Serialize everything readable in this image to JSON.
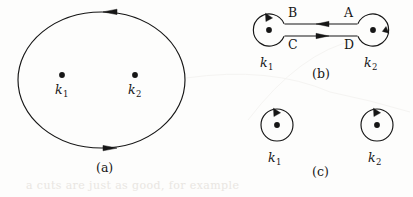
{
  "figure": {
    "background_color": "#fdfdfc",
    "ink_color": "#161616",
    "bleed_color": "#e9e6e2",
    "width": 413,
    "height": 197
  },
  "panels": [
    {
      "id": "a",
      "caption": "(a)",
      "caption_x": 96,
      "caption_y": 162,
      "description": "single large counterclockwise contour enclosing both poles",
      "contour": {
        "shape": "ellipse",
        "cx": 101.5,
        "cy": 80,
        "rx": 83.5,
        "ry": 68,
        "orientation": "counterclockwise",
        "arrows": [
          {
            "position": "top",
            "direction": "left",
            "x": 110,
            "y": 12
          },
          {
            "position": "bottom",
            "direction": "right",
            "x": 110,
            "y": 148
          }
        ]
      },
      "poles": [
        {
          "label": "k",
          "subscript": "1",
          "dot_x": 62,
          "dot_y": 75,
          "label_x": 55,
          "label_y": 84
        },
        {
          "label": "k",
          "subscript": "2",
          "dot_x": 135,
          "dot_y": 75,
          "label_x": 128,
          "label_y": 84
        }
      ]
    },
    {
      "id": "b",
      "caption": "(b)",
      "caption_x": 312,
      "caption_y": 68,
      "description": "two small contours joined by a two-way bridge of oppositely directed segments",
      "circles": [
        {
          "cx": 269,
          "cy": 30,
          "r": 16,
          "orientation": "counterclockwise",
          "arrow_position": "top",
          "arrow_direction": "left",
          "pole_label": "k",
          "pole_subscript": "1",
          "label_x": 255,
          "label_y": 58
        },
        {
          "cx": 373,
          "cy": 30,
          "r": 16,
          "orientation": "counterclockwise",
          "arrow_position": "right",
          "arrow_direction": "up",
          "pole_label": "k",
          "pole_subscript": "2",
          "label_x": 359,
          "label_y": 58
        }
      ],
      "bridge": [
        {
          "name": "upper",
          "y": 24,
          "x_start": 285,
          "x_end": 357,
          "arrow_direction": "left",
          "arrow_x": 323,
          "left_label": "B",
          "left_label_x": 285,
          "left_label_y": 10,
          "right_label": "A",
          "right_label_x": 344,
          "right_label_y": 10
        },
        {
          "name": "lower",
          "y": 36,
          "x_start": 285,
          "x_end": 357,
          "arrow_direction": "right",
          "arrow_x": 323,
          "left_label": "C",
          "left_label_x": 285,
          "left_label_y": 40,
          "right_label": "D",
          "right_label_x": 344,
          "right_label_y": 40
        }
      ]
    },
    {
      "id": "c",
      "caption": "(c)",
      "caption_x": 312,
      "caption_y": 166,
      "description": "two separate counterclockwise contours, one around each pole",
      "circles": [
        {
          "cx": 277,
          "cy": 125,
          "r": 16,
          "orientation": "counterclockwise",
          "arrow_position": "top",
          "arrow_direction": "left",
          "pole_label": "k",
          "pole_subscript": "1",
          "label_x": 263,
          "label_y": 153
        },
        {
          "cx": 377,
          "cy": 125,
          "r": 16,
          "orientation": "counterclockwise",
          "arrow_position": "top",
          "arrow_direction": "left",
          "pole_label": "k",
          "pole_subscript": "2",
          "label_x": 363,
          "label_y": 153
        }
      ]
    }
  ],
  "labels": {
    "pole_k1": "k",
    "pole_k1_sub": "1",
    "pole_k2": "k",
    "pole_k2_sub": "2",
    "segment_a": "A",
    "segment_b": "B",
    "segment_c": "C",
    "segment_d": "D",
    "caption_a": "(a)",
    "caption_b": "(b)",
    "caption_c": "(c)"
  },
  "scan_artifacts": {
    "bottom_text": "a cuts are just as good, for example"
  }
}
